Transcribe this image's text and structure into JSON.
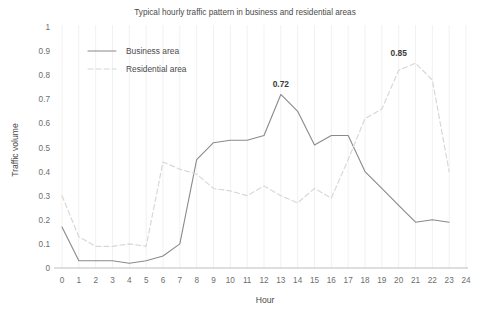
{
  "chart_data": {
    "type": "line",
    "title": "Typical hourly traffic pattern in business and residential areas",
    "xlabel": "Hour",
    "ylabel": "Traffic volume",
    "xlim": [
      0,
      24
    ],
    "ylim": [
      0,
      1
    ],
    "x": [
      0,
      1,
      2,
      3,
      4,
      5,
      6,
      7,
      8,
      9,
      10,
      11,
      12,
      13,
      14,
      15,
      16,
      17,
      18,
      19,
      20,
      21,
      22,
      23
    ],
    "xticks": [
      "0",
      "1",
      "2",
      "3",
      "4",
      "5",
      "6",
      "7",
      "8",
      "9",
      "10",
      "11",
      "12",
      "13",
      "14",
      "15",
      "16",
      "17",
      "18",
      "19",
      "20",
      "21",
      "22",
      "23",
      "24"
    ],
    "yticks": [
      "0",
      "0.1",
      "0.2",
      "0.3",
      "0.4",
      "0.5",
      "0.6",
      "0.7",
      "0.8",
      "0.9",
      "1"
    ],
    "grid": "vertical",
    "legend_position": "top-left",
    "series": [
      {
        "name": "Business area",
        "style": "solid",
        "color": "#8a8a8a",
        "values": [
          0.17,
          0.03,
          0.03,
          0.03,
          0.02,
          0.03,
          0.05,
          0.1,
          0.45,
          0.52,
          0.53,
          0.53,
          0.55,
          0.72,
          0.65,
          0.51,
          0.55,
          0.55,
          0.4,
          0.33,
          0.26,
          0.19,
          0.2,
          0.19
        ]
      },
      {
        "name": "Residential area",
        "style": "dashed",
        "color": "#d8d8d8",
        "values": [
          0.3,
          0.13,
          0.09,
          0.09,
          0.1,
          0.09,
          0.44,
          0.41,
          0.39,
          0.33,
          0.32,
          0.3,
          0.34,
          0.3,
          0.27,
          0.33,
          0.29,
          0.45,
          0.62,
          0.66,
          0.82,
          0.85,
          0.78,
          0.4
        ]
      }
    ],
    "annotations": [
      {
        "label": "0.72",
        "x": 13,
        "y": 0.72,
        "series": "Business area"
      },
      {
        "label": "0.85",
        "x": 20,
        "y": 0.85,
        "series": "Residential area"
      }
    ]
  },
  "legend": {
    "items": [
      {
        "label": "Business area"
      },
      {
        "label": "Residential area"
      }
    ]
  }
}
